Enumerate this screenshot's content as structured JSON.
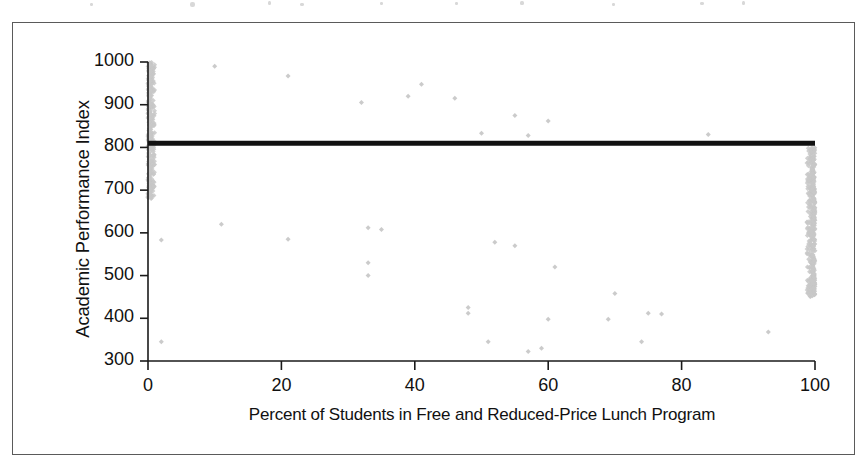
{
  "figure": {
    "background_color": "#ffffff",
    "frame_color": "#5a5a5a",
    "axis_color": "#1a1a1a"
  },
  "axes": {
    "y_title": "Academic Performance Index",
    "x_title": "Percent of Students in Free and Reduced-Price Lunch Program"
  },
  "chart_data": {
    "type": "scatter",
    "title": "",
    "subtitle": "",
    "xlabel": "Percent of Students in Free and Reduced-Price Lunch Program",
    "ylabel": "Academic Performance Index",
    "xlim": [
      0,
      100
    ],
    "ylim": [
      300,
      1000
    ],
    "xticks": [
      0,
      20,
      40,
      60,
      80,
      100
    ],
    "yticks": [
      300,
      400,
      500,
      600,
      700,
      800,
      900,
      1000
    ],
    "xtick_labels": [
      "0",
      "20",
      "40",
      "60",
      "80",
      "100"
    ],
    "ytick_labels": [
      "300",
      "400",
      "500",
      "600",
      "700",
      "800",
      "900",
      "1000"
    ],
    "grid": false,
    "legend": null,
    "legend_position": "none",
    "marker": {
      "shape": "diamond",
      "color": "#c8c8c8",
      "size_px": 5,
      "edge_color": "#c0c0c0"
    },
    "annotations": [
      {
        "type": "horizontal-reference-line",
        "name": "statewide-api-target-line",
        "y": 810,
        "x_start": 0,
        "x_end": 100,
        "color": "#111111",
        "width_px": 5,
        "label": ""
      }
    ],
    "n_points_approx": 6400,
    "series": [
      {
        "name": "Schools",
        "color": "#c8c8c8",
        "trend": "negative",
        "regression": {
          "slope_per_percent": -2.45,
          "intercept_api": 875,
          "residual_sd": 72
        },
        "spread_model": {
          "sd_at_x0": 62,
          "sd_at_x100": 78
        },
        "edge_pileups": [
          {
            "x": 0,
            "count": 210,
            "api_low": 680,
            "api_high": 1000
          },
          {
            "x": 100,
            "count": 230,
            "api_low": 450,
            "api_high": 800
          }
        ],
        "low_outliers": [
          {
            "x": 33,
            "y": 530
          },
          {
            "x": 33,
            "y": 500
          },
          {
            "x": 48,
            "y": 425
          },
          {
            "x": 48,
            "y": 412
          },
          {
            "x": 51,
            "y": 345
          },
          {
            "x": 57,
            "y": 322
          },
          {
            "x": 59,
            "y": 330
          },
          {
            "x": 60,
            "y": 398
          },
          {
            "x": 61,
            "y": 520
          },
          {
            "x": 69,
            "y": 398
          },
          {
            "x": 70,
            "y": 458
          },
          {
            "x": 74,
            "y": 345
          },
          {
            "x": 75,
            "y": 412
          },
          {
            "x": 77,
            "y": 410
          },
          {
            "x": 93,
            "y": 368
          },
          {
            "x": 2,
            "y": 583
          },
          {
            "x": 2,
            "y": 345
          },
          {
            "x": 11,
            "y": 620
          },
          {
            "x": 21,
            "y": 585
          },
          {
            "x": 35,
            "y": 608
          },
          {
            "x": 33,
            "y": 612
          },
          {
            "x": 52,
            "y": 578
          },
          {
            "x": 55,
            "y": 570
          }
        ],
        "high_outliers": [
          {
            "x": 10,
            "y": 990
          },
          {
            "x": 21,
            "y": 967
          },
          {
            "x": 32,
            "y": 905
          },
          {
            "x": 41,
            "y": 948
          },
          {
            "x": 39,
            "y": 920
          },
          {
            "x": 46,
            "y": 915
          },
          {
            "x": 55,
            "y": 875
          },
          {
            "x": 60,
            "y": 862
          },
          {
            "x": 84,
            "y": 830
          },
          {
            "x": 57,
            "y": 828
          },
          {
            "x": 50,
            "y": 833
          }
        ]
      }
    ]
  }
}
